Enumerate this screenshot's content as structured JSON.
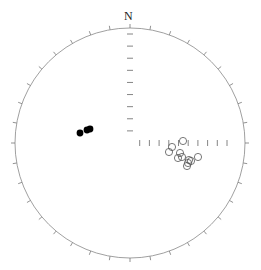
{
  "plot": {
    "title": "",
    "north_label": "N",
    "colors": {
      "primitive": "#888888",
      "ticks": "#777777",
      "filled_points": "#000000",
      "open_points": "#555555"
    }
  },
  "chart_data": {
    "type": "scatter",
    "projection": "equal-area stereonet (lower hemisphere)",
    "title": "",
    "labels": [
      "N"
    ],
    "center_px": [
      130,
      143
    ],
    "radius_px": 115,
    "perimeter_tick_interval_deg": 10,
    "axis_ticks": {
      "north_axis": 9,
      "east_axis": 10
    },
    "series": [
      {
        "name": "filled",
        "marker": "filled-circle",
        "points_px": [
          [
            80,
            133
          ],
          [
            87,
            130
          ],
          [
            90,
            129
          ]
        ]
      },
      {
        "name": "open",
        "marker": "open-circle",
        "points_px": [
          [
            183,
            141
          ],
          [
            172,
            147
          ],
          [
            169,
            152
          ],
          [
            180,
            153
          ],
          [
            178,
            158
          ],
          [
            182,
            157
          ],
          [
            189,
            160
          ],
          [
            191,
            161
          ],
          [
            198,
            157
          ],
          [
            188,
            163
          ],
          [
            187,
            166
          ]
        ]
      }
    ]
  }
}
